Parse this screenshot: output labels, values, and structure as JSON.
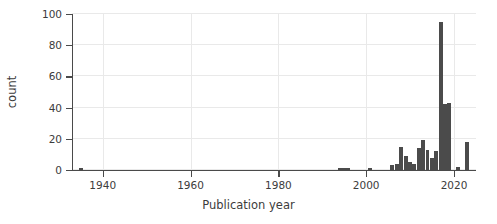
{
  "chart_data": {
    "type": "bar",
    "title": "",
    "subtitle": "",
    "xlabel": "Publication year",
    "ylabel": "count",
    "xlim": [
      1933,
      2025
    ],
    "ylim": [
      0,
      100
    ],
    "xticks": [
      1940,
      1960,
      1980,
      2000,
      2020
    ],
    "xtick_labels": [
      "1940",
      "1960",
      "1980",
      "2000",
      "2020"
    ],
    "yticks": [
      0,
      20,
      40,
      60,
      80,
      100
    ],
    "ytick_labels": [
      "0",
      "20",
      "40",
      "60",
      "80",
      "100"
    ],
    "grid": "horizontal-and-vertical-faint",
    "legend": "none",
    "bar_color": "#4b4b4b",
    "background_color": "#ffffff",
    "axis_color": "#4a4a4a",
    "grid_color": "#e9e9e9",
    "bin_width": 1,
    "categories": [
      1935,
      1994,
      1995,
      1996,
      2001,
      2006,
      2007,
      2008,
      2009,
      2010,
      2011,
      2012,
      2013,
      2014,
      2015,
      2016,
      2017,
      2018,
      2019,
      2021,
      2023
    ],
    "values": [
      1,
      1,
      1,
      1,
      1,
      3,
      4,
      15,
      9,
      5,
      4,
      14,
      19,
      13,
      8,
      12,
      95,
      42,
      43,
      2,
      18
    ],
    "max_value": 95,
    "max_value_year": 2017,
    "annotations": []
  },
  "figure": {
    "alt": "Histogram of publication counts by publication year"
  }
}
